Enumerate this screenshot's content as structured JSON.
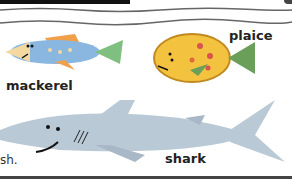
{
  "header_bar": {
    "color": "#111111"
  },
  "labels": {
    "mackerel": "mackerel",
    "plaice": "plaice",
    "shark": "shark",
    "text_fragment": "sh."
  },
  "colors": {
    "mackerel_body": "#8ab7e0",
    "mackerel_fins": "#f0a04b",
    "plaice_body": "#f3c340",
    "plaice_spots": "#d9534f",
    "shark_body": "#b9c9d6",
    "wave_line": "#666666"
  }
}
